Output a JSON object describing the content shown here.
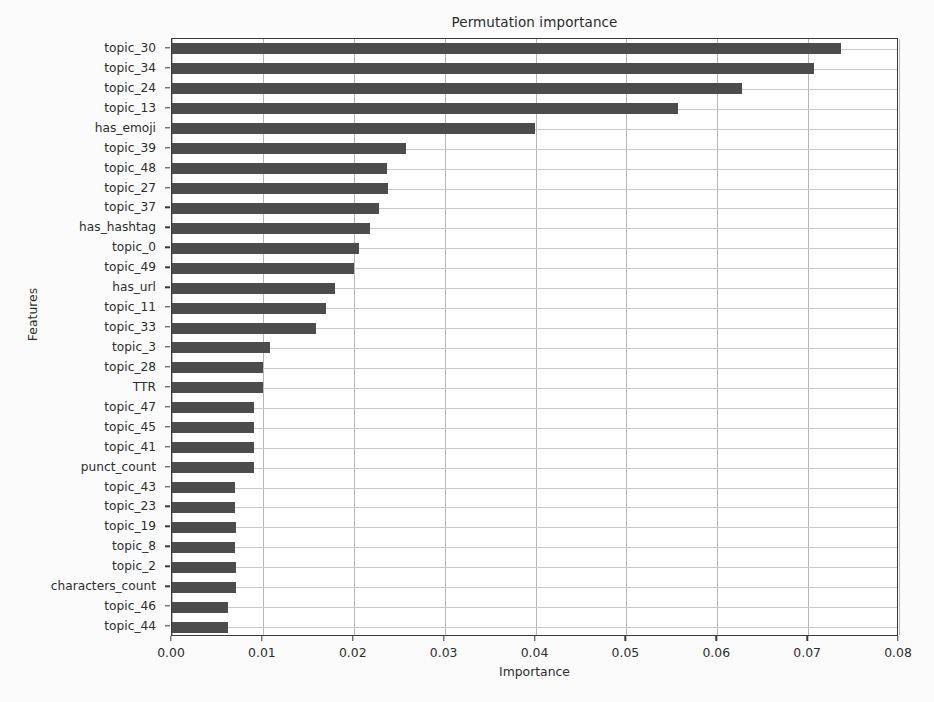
{
  "chart_data": {
    "type": "bar",
    "orientation": "horizontal",
    "title": "Permutation importance",
    "xlabel": "Importance",
    "ylabel": "Features",
    "xlim": [
      0.0,
      0.08
    ],
    "ylim_categories_top_to_bottom": true,
    "grid": true,
    "legend": null,
    "bar_color": "#4c4c4c",
    "xticks": [
      "0.00",
      "0.01",
      "0.02",
      "0.03",
      "0.04",
      "0.05",
      "0.06",
      "0.07",
      "0.08"
    ],
    "xtick_values": [
      0.0,
      0.01,
      0.02,
      0.03,
      0.04,
      0.05,
      0.06,
      0.07,
      0.08
    ],
    "categories": [
      "topic_30",
      "topic_34",
      "topic_24",
      "topic_13",
      "has_emoji",
      "topic_39",
      "topic_48",
      "topic_27",
      "topic_37",
      "has_hashtag",
      "topic_0",
      "topic_49",
      "has_url",
      "topic_11",
      "topic_33",
      "topic_3",
      "topic_28",
      "TTR",
      "topic_47",
      "topic_45",
      "topic_41",
      "punct_count",
      "topic_43",
      "topic_23",
      "topic_19",
      "topic_8",
      "topic_2",
      "characters_count",
      "topic_46",
      "topic_44"
    ],
    "values": [
      0.0736,
      0.0706,
      0.0627,
      0.0557,
      0.0399,
      0.0257,
      0.0237,
      0.0238,
      0.0228,
      0.0218,
      0.0206,
      0.02,
      0.0179,
      0.017,
      0.0158,
      0.0108,
      0.01,
      0.01,
      0.009,
      0.009,
      0.009,
      0.009,
      0.0069,
      0.0069,
      0.007,
      0.0069,
      0.007,
      0.007,
      0.0062,
      0.0062
    ]
  }
}
